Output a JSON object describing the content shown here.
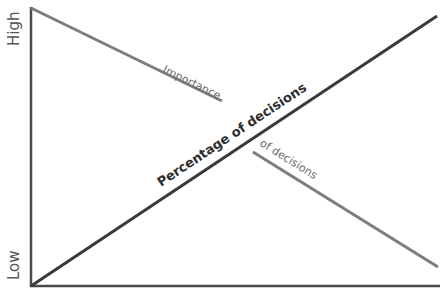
{
  "diagram": {
    "y_axis": {
      "high_label": "High",
      "low_label": "Low"
    },
    "lines": [
      {
        "name": "importance-of-decisions",
        "label_part1": "Importance",
        "label_part2": "of decisions",
        "trend": "decreasing",
        "color": "#7a7a7a"
      },
      {
        "name": "percentage-of-decisions",
        "label": "Percentage of decisions",
        "trend": "increasing",
        "color": "#3a3a3a"
      }
    ],
    "colors": {
      "axis": "#4a4a4a",
      "background": "#ffffff"
    }
  }
}
